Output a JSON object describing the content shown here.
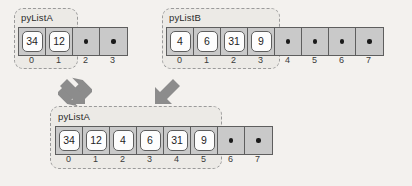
{
  "figure": {
    "background_color": "#f3f1ee",
    "cell_fill_color": "#c9c9c9",
    "cell_border_color": "#5e5e5e",
    "chip_fill_color": "#fdfdfd",
    "arrow_color": "#8c8c8c",
    "region_border_color": "#9a9a9a"
  },
  "lists": [
    {
      "id": "top-left",
      "label": "pyListA",
      "capacity": 4,
      "length": 2,
      "cells": [
        {
          "index": "0",
          "value": "34",
          "occupied": true
        },
        {
          "index": "1",
          "value": "12",
          "occupied": true
        },
        {
          "index": "2",
          "value": "",
          "occupied": false
        },
        {
          "index": "3",
          "value": "",
          "occupied": false
        }
      ]
    },
    {
      "id": "top-right",
      "label": "pyListB",
      "capacity": 8,
      "length": 4,
      "cells": [
        {
          "index": "0",
          "value": "4",
          "occupied": true
        },
        {
          "index": "1",
          "value": "6",
          "occupied": true
        },
        {
          "index": "2",
          "value": "31",
          "occupied": true
        },
        {
          "index": "3",
          "value": "9",
          "occupied": true
        },
        {
          "index": "4",
          "value": "",
          "occupied": false
        },
        {
          "index": "5",
          "value": "",
          "occupied": false
        },
        {
          "index": "6",
          "value": "",
          "occupied": false
        },
        {
          "index": "7",
          "value": "",
          "occupied": false
        }
      ]
    },
    {
      "id": "bottom-result",
      "label": "pyListA",
      "capacity": 8,
      "length": 6,
      "cells": [
        {
          "index": "0",
          "value": "34",
          "occupied": true
        },
        {
          "index": "1",
          "value": "12",
          "occupied": true
        },
        {
          "index": "2",
          "value": "4",
          "occupied": true
        },
        {
          "index": "3",
          "value": "6",
          "occupied": true
        },
        {
          "index": "4",
          "value": "31",
          "occupied": true
        },
        {
          "index": "5",
          "value": "9",
          "occupied": true
        },
        {
          "index": "6",
          "value": "",
          "occupied": false
        },
        {
          "index": "7",
          "value": "",
          "occupied": false
        }
      ]
    }
  ],
  "arrows": [
    {
      "id": "arrow-from-a",
      "direction": "down-right"
    },
    {
      "id": "arrow-from-b",
      "direction": "down-left"
    }
  ]
}
